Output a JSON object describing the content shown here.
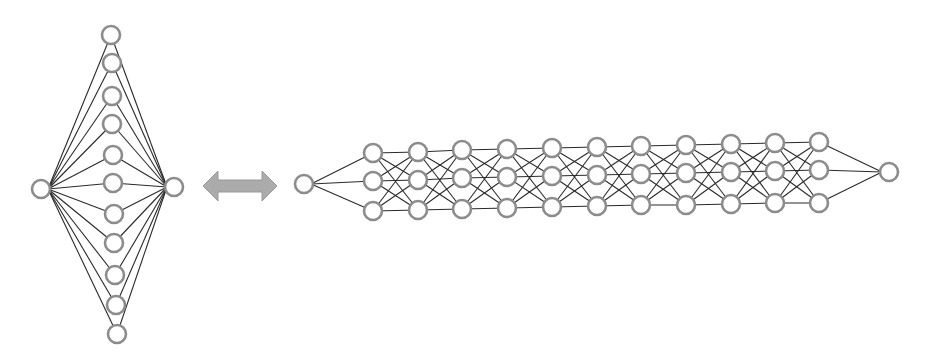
{
  "colors": {
    "background": "#ffffff",
    "node_stroke": "#8c8c8c",
    "node_fill": "#ffffff",
    "edge": "#2a2a2a",
    "arrow_fill": "#ababab",
    "arrow_stroke": "#9a9a9a"
  },
  "node_radius": 9,
  "wide_network": {
    "label": "shallow-wide network",
    "input": {
      "x": 41,
      "y": 189
    },
    "output": {
      "x": 174,
      "y": 187
    },
    "hidden": [
      {
        "x": 111,
        "y": 35
      },
      {
        "x": 112,
        "y": 63
      },
      {
        "x": 112,
        "y": 96
      },
      {
        "x": 112,
        "y": 124
      },
      {
        "x": 113,
        "y": 155
      },
      {
        "x": 113,
        "y": 183
      },
      {
        "x": 114,
        "y": 214
      },
      {
        "x": 114,
        "y": 243
      },
      {
        "x": 115,
        "y": 275
      },
      {
        "x": 116,
        "y": 305
      },
      {
        "x": 117,
        "y": 334
      }
    ]
  },
  "equivalence_arrow": {
    "label": "double-headed arrow",
    "x1": 203,
    "x2": 277,
    "y": 186
  },
  "deep_network": {
    "label": "deep-narrow network",
    "input": {
      "x": 304,
      "y": 184
    },
    "output": {
      "x": 889,
      "y": 172
    },
    "layers": [
      {
        "x": 373,
        "ys": [
          153,
          181,
          211
        ]
      },
      {
        "x": 418,
        "ys": [
          152,
          180,
          210
        ]
      },
      {
        "x": 462,
        "ys": [
          150,
          178,
          209
        ]
      },
      {
        "x": 507,
        "ys": [
          149,
          177,
          208
        ]
      },
      {
        "x": 552,
        "ys": [
          148,
          176,
          207
        ]
      },
      {
        "x": 597,
        "ys": [
          147,
          175,
          206
        ]
      },
      {
        "x": 641,
        "ys": [
          146,
          174,
          205
        ]
      },
      {
        "x": 686,
        "ys": [
          145,
          173,
          205
        ]
      },
      {
        "x": 731,
        "ys": [
          144,
          172,
          204
        ]
      },
      {
        "x": 775,
        "ys": [
          143,
          171,
          203
        ]
      },
      {
        "x": 819,
        "ys": [
          142,
          170,
          203
        ]
      }
    ]
  }
}
